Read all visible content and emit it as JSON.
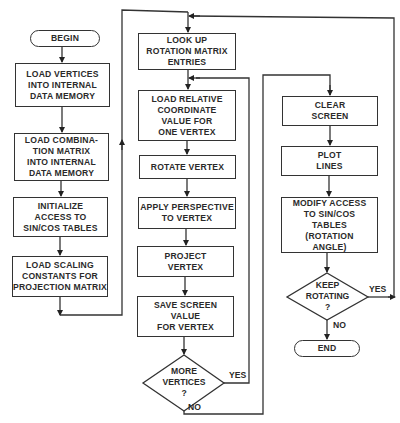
{
  "diagram": {
    "type": "flowchart",
    "nodes": {
      "begin": "BEGIN",
      "load_vertices": "LOAD VERTICES\nINTO INTERNAL\nDATA MEMORY",
      "load_combination": "LOAD COMBINA-\nTION MATRIX\nINTO INTERNAL\nDATA MEMORY",
      "init_access": "INITIALIZE\nACCESS TO\nSIN/COS TABLES",
      "load_scaling": "LOAD SCALING\nCONSTANTS FOR\nPROJECTION MATRIX",
      "lookup_rotation": "LOOK UP\nROTATION MATRIX\nENTRIES",
      "load_relative": "LOAD RELATIVE\nCOORDINATE\nVALUE FOR\nONE VERTEX",
      "rotate_vertex": "ROTATE VERTEX",
      "apply_perspective": "APPLY PERSPECTIVE\nTO VERTEX",
      "project_vertex": "PROJECT\nVERTEX",
      "save_screen": "SAVE SCREEN\nVALUE\nFOR VERTEX",
      "more_vertices": "MORE\nVERTICES\n?",
      "clear_screen": "CLEAR\nSCREEN",
      "plot_lines": "PLOT\nLINES",
      "modify_access": "MODIFY ACCESS\nTO SIN/COS\nTABLES\n(ROTATION\nANGLE)",
      "keep_rotating": "KEEP\nROTATING\n?",
      "end": "END"
    },
    "edge_labels": {
      "more_vertices_yes": "YES",
      "more_vertices_no": "NO",
      "keep_rotating_yes": "YES",
      "keep_rotating_no": "NO"
    },
    "edges": [
      {
        "from": "begin",
        "to": "load_vertices"
      },
      {
        "from": "load_vertices",
        "to": "load_combination"
      },
      {
        "from": "load_combination",
        "to": "init_access"
      },
      {
        "from": "init_access",
        "to": "load_scaling"
      },
      {
        "from": "load_scaling",
        "to": "lookup_rotation"
      },
      {
        "from": "lookup_rotation",
        "to": "load_relative"
      },
      {
        "from": "load_relative",
        "to": "rotate_vertex"
      },
      {
        "from": "rotate_vertex",
        "to": "apply_perspective"
      },
      {
        "from": "apply_perspective",
        "to": "project_vertex"
      },
      {
        "from": "project_vertex",
        "to": "save_screen"
      },
      {
        "from": "save_screen",
        "to": "more_vertices"
      },
      {
        "from": "more_vertices",
        "to": "load_relative",
        "label": "YES"
      },
      {
        "from": "more_vertices",
        "to": "clear_screen",
        "label": "NO"
      },
      {
        "from": "clear_screen",
        "to": "plot_lines"
      },
      {
        "from": "plot_lines",
        "to": "modify_access"
      },
      {
        "from": "modify_access",
        "to": "keep_rotating"
      },
      {
        "from": "keep_rotating",
        "to": "lookup_rotation",
        "label": "YES"
      },
      {
        "from": "keep_rotating",
        "to": "end",
        "label": "NO"
      }
    ],
    "colors": {
      "line": "#333333",
      "background": "#ffffff",
      "text": "#2a2a2a"
    }
  }
}
